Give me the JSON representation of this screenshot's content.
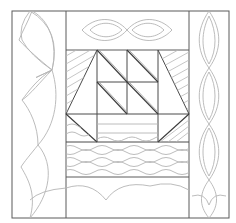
{
  "colors": {
    "frame": "#5a5a5a",
    "seam": "#4a4a4a",
    "quilting": "#b4b4b4",
    "background": "#ffffff"
  },
  "layout": {
    "border_left_motif": "scallop",
    "border_right_motif": "cable-braid",
    "border_top_motif": "double-loop",
    "border_bottom_motif": "scallop",
    "center_block": {
      "sail_grid_columns": 2,
      "sail_grid_rows": 2,
      "side_panels": "diagonal-hatch",
      "hull": "trapezoid-with-stripes",
      "water": "wave-lines"
    }
  }
}
